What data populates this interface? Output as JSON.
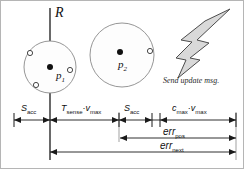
{
  "figure": {
    "background_color": "#ffffff",
    "line_color": "#1a1a1a",
    "circle_stroke": "#8a8a8a",
    "bolt_fill": "#d9d9d9",
    "bolt_stroke": "#4d4d4d"
  },
  "nodes": [
    {
      "id": "node-1",
      "label": "p",
      "subscript": "1",
      "center_x": 50,
      "center_y": 67,
      "radius": 26,
      "members": 3
    },
    {
      "id": "node-2",
      "label": "p",
      "subscript": "2",
      "center_x": 122,
      "center_y": 55,
      "radius": 32,
      "members": 1
    }
  ],
  "reference_line": {
    "label": "R",
    "x": 50
  },
  "event": {
    "icon": "lightning-bolt-icon",
    "caption": "Send update msg."
  },
  "segments": [
    {
      "id": "seg-s-acc-1",
      "label": "S",
      "subscript": "acc",
      "operator": "",
      "label2": "",
      "subscript2": "",
      "x_start": 14,
      "x_end": 50
    },
    {
      "id": "seg-t-sense-vmax",
      "label": "T",
      "subscript": "sense",
      "operator": "·",
      "label2": "v",
      "subscript2": "max",
      "x_start": 50,
      "x_end": 119
    },
    {
      "id": "seg-s-acc-2",
      "label": "S",
      "subscript": "acc",
      "operator": "",
      "label2": "",
      "subscript2": "",
      "x_start": 119,
      "x_end": 152
    },
    {
      "id": "seg-c-max-vmax",
      "label": "c",
      "subscript": "max",
      "operator": "·",
      "label2": "v",
      "subscript2": "max",
      "x_start": 160,
      "x_end": 236
    }
  ],
  "error_spans": [
    {
      "id": "err-pos",
      "label": "err",
      "subscript": "pos",
      "x_start": 120,
      "x_end": 236,
      "y": 138
    },
    {
      "id": "err-next",
      "label": "err",
      "subscript": "next",
      "x_start": 50,
      "x_end": 236,
      "y": 152
    }
  ],
  "axis": {
    "y": 120,
    "tick_positions": [
      14,
      50,
      119,
      152,
      160,
      236
    ]
  }
}
